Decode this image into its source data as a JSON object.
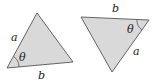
{
  "colors": {
    "fill": "#d9d9d9",
    "stroke": "#555555"
  },
  "triangles": [
    {
      "name": "left",
      "vertices": [
        [
          7,
          68
        ],
        [
          37,
          13
        ],
        [
          73,
          62
        ]
      ],
      "labels": {
        "side_a": "a",
        "side_b": "b",
        "angle": "θ"
      }
    },
    {
      "name": "right",
      "vertices": [
        [
          81,
          17
        ],
        [
          149,
          20
        ],
        [
          112,
          72
        ]
      ],
      "labels": {
        "side_a": "a",
        "side_b": "b",
        "angle": "θ"
      }
    }
  ]
}
